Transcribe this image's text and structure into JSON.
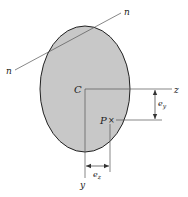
{
  "figure": {
    "type": "cross-section",
    "shape": "ellipse",
    "colors": {
      "fill": "#c8c8c8",
      "outline": "#222222",
      "line": "#555555",
      "background": "#ffffff"
    },
    "labels": {
      "neutral_axis_start": "n",
      "neutral_axis_end": "n",
      "centroid": "C",
      "z_axis": "z",
      "y_axis": "y",
      "load_point": "P",
      "load_marker": "×",
      "ey_base": "e",
      "ey_sub": "y",
      "ez_base": "e",
      "ez_sub": "z"
    }
  }
}
